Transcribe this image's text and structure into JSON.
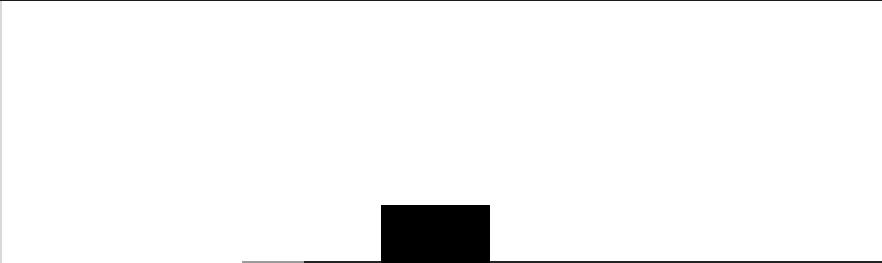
{
  "canvas": {
    "background": "#ffffff",
    "text": ""
  },
  "shapes": {
    "block_color": "#000000",
    "line_color": "#222222",
    "top_border_color": "#1a1a1a"
  }
}
